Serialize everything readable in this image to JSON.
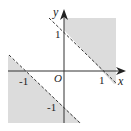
{
  "diagram": {
    "type": "inequality-region",
    "axes": {
      "x_label": "x",
      "y_label": "y",
      "origin_label": "O"
    },
    "ticks": {
      "x_pos": "1",
      "x_neg": "-1",
      "y_pos": "1",
      "y_neg": "-1"
    },
    "lines": [
      {
        "equation": "x+y=1",
        "style": "dashed"
      },
      {
        "equation": "x+y=-1",
        "style": "dashed"
      }
    ],
    "colors": {
      "shade": "#dcdcdc",
      "axis": "#333333",
      "line": "#333333"
    }
  }
}
